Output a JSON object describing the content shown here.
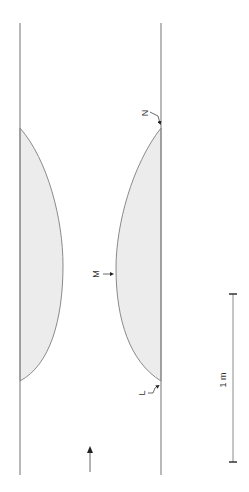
{
  "diagram": {
    "labels": {
      "N": "N",
      "M": "M",
      "L": "L",
      "scale": "1 m"
    },
    "colors": {
      "line": "#8a8a8a",
      "fill": "#ececec",
      "text": "#333333",
      "arrow": "#222222"
    },
    "elements": {
      "left_wall": "vertical line",
      "right_wall": "vertical line",
      "left_deposit": "shaded lens",
      "right_deposit": "shaded lens",
      "flow_arrow": "upward arrow",
      "scale_bar": "1 m"
    }
  }
}
